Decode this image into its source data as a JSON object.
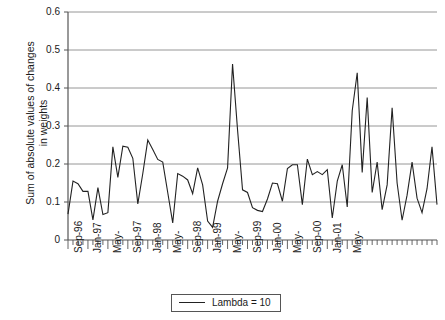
{
  "chart_data": {
    "type": "line",
    "title": "",
    "xlabel": "",
    "ylabel": "Sum of absolute values of changes\nin weights",
    "ylim": [
      0,
      0.6
    ],
    "yticks": [
      "0",
      "0.1",
      "0.2",
      "0.3",
      "0.4",
      "0.5",
      "0.6"
    ],
    "ytick_values": [
      0,
      0.1,
      0.2,
      0.3,
      0.4,
      0.5,
      0.6
    ],
    "grid": true,
    "legend_position": "bottom",
    "legend": [
      "Lambda  = 10"
    ],
    "xtick_labels": [
      "Sep-96",
      "Jan-97",
      "May-",
      "Sep-97",
      "Jan-98",
      "May-",
      "Sep-98",
      "Jan-99",
      "May-",
      "Sep-99",
      "Jan-00",
      "May-",
      "Sep-00",
      "Jan-01",
      "May-"
    ],
    "xtick_index": [
      0,
      4,
      8,
      12,
      16,
      20,
      24,
      28,
      32,
      36,
      40,
      44,
      48,
      52,
      56
    ],
    "minor_tick_interval": 1,
    "series": [
      {
        "name": "Lambda  = 10",
        "color": "#222222",
        "values": [
          0.068,
          0.155,
          0.148,
          0.128,
          0.128,
          0.053,
          0.138,
          0.067,
          0.072,
          0.245,
          0.165,
          0.247,
          0.244,
          0.215,
          0.095,
          0.175,
          0.263,
          0.238,
          0.212,
          0.205,
          0.125,
          0.045,
          0.175,
          0.168,
          0.158,
          0.122,
          0.19,
          0.145,
          0.05,
          0.033,
          0.102,
          0.148,
          0.19,
          0.463,
          0.29,
          0.132,
          0.125,
          0.085,
          0.078,
          0.075,
          0.108,
          0.15,
          0.148,
          0.102,
          0.188,
          0.198,
          0.198,
          0.093,
          0.213,
          0.172,
          0.18,
          0.172,
          0.185,
          0.058,
          0.155,
          0.198,
          0.087,
          0.34,
          0.44,
          0.178,
          0.375,
          0.125,
          0.205,
          0.08,
          0.145,
          0.348,
          0.15,
          0.052,
          0.118,
          0.205,
          0.11,
          0.072,
          0.135,
          0.245,
          0.093
        ]
      }
    ]
  }
}
